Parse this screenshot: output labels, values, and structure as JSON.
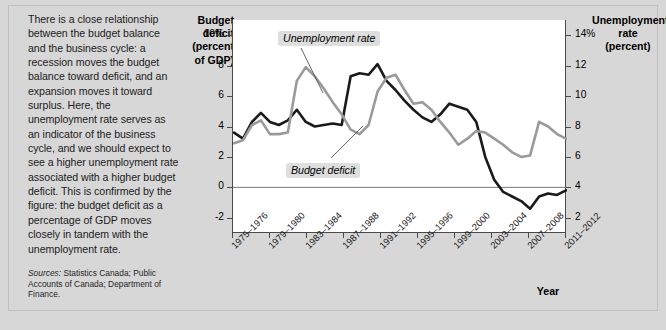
{
  "figure": {
    "caption": "There is a close relationship between the budget balance and the business cycle: a recession moves the budget balance toward deficit, and an expansion moves it toward surplus. Here, the unemployment rate serves as an indicator of the business cycle, and we should expect to see a higher unemployment rate associated with a higher budget deficit. This is confirmed by the figure: the budget deficit as a percentage of GDP moves closely in tandem with the unemployment rate.",
    "sources_label": "Sources:",
    "sources_text": "Statistics Canada; Public Accounts of Canada; Department of Finance."
  },
  "chart_data": {
    "type": "line",
    "title": "",
    "xlabel": "Year",
    "ylabel": "Budget deficit (percent of GDP)",
    "ylabel_lines": [
      "Budget",
      "deficit",
      "(percent",
      "of GDP)"
    ],
    "y2label": "Unemployment rate (percent)",
    "y2label_lines": [
      "Unemployment",
      "rate",
      "(percent)"
    ],
    "grid": false,
    "legend_position": "inline-annotations",
    "ylim": [
      -3,
      11
    ],
    "yticks": [
      10,
      8,
      6,
      4,
      2,
      0,
      -2
    ],
    "ytick_labels": [
      "10%",
      "8",
      "6",
      "4",
      "2",
      "0",
      "-2"
    ],
    "y2lim": [
      1,
      15
    ],
    "y2ticks": [
      14,
      12,
      10,
      8,
      6,
      4,
      2
    ],
    "y2tick_labels": [
      "14%",
      "12",
      "10",
      "8",
      "6",
      "4",
      "2"
    ],
    "zero_line": 0,
    "xtick_labels": [
      "1975–1976",
      "1979–1980",
      "1983–1984",
      "1987–1988",
      "1991–1992",
      "1995–1996",
      "1999–2000",
      "2003–2004",
      "2007–2008",
      "2011–2012"
    ],
    "x_start_year": 1975,
    "x_end_year": 2012,
    "series": [
      {
        "name": "Budget deficit",
        "axis": "left",
        "color": "#1a1a1a",
        "x": [
          1975,
          1976,
          1977,
          1978,
          1979,
          1980,
          1981,
          1982,
          1983,
          1984,
          1985,
          1986,
          1987,
          1988,
          1989,
          1990,
          1991,
          1992,
          1993,
          1994,
          1995,
          1996,
          1997,
          1998,
          1999,
          2000,
          2001,
          2002,
          2003,
          2004,
          2005,
          2006,
          2007,
          2008,
          2009,
          2010,
          2011,
          2012
        ],
        "values": [
          3.6,
          3.2,
          4.3,
          4.9,
          4.3,
          4.1,
          4.4,
          5.1,
          4.3,
          4.0,
          4.1,
          4.2,
          4.1,
          7.3,
          7.5,
          7.4,
          8.1,
          7.0,
          6.4,
          5.7,
          5.1,
          4.6,
          4.3,
          4.8,
          5.5,
          5.3,
          5.1,
          4.3,
          2.0,
          0.5,
          -0.3,
          -0.6,
          -0.9,
          -1.4,
          -0.6,
          -0.4,
          -0.5,
          -0.2
        ]
      },
      {
        "name": "Unemployment rate",
        "axis": "right",
        "color": "#9a9a9a",
        "x": [
          1975,
          1976,
          1977,
          1978,
          1979,
          1980,
          1981,
          1982,
          1983,
          1984,
          1985,
          1986,
          1987,
          1988,
          1989,
          1990,
          1991,
          1992,
          1993,
          1994,
          1995,
          1996,
          1997,
          1998,
          1999,
          2000,
          2001,
          2002,
          2003,
          2004,
          2005,
          2006,
          2007,
          2008,
          2009,
          2010,
          2011,
          2012
        ],
        "values": [
          6.9,
          7.1,
          8.1,
          8.4,
          7.5,
          7.5,
          7.6,
          11.0,
          11.9,
          11.3,
          10.5,
          9.6,
          8.8,
          7.8,
          7.5,
          8.1,
          10.3,
          11.2,
          11.4,
          10.4,
          9.5,
          9.6,
          9.1,
          8.3,
          7.6,
          6.8,
          7.2,
          7.7,
          7.6,
          7.2,
          6.8,
          6.3,
          6.0,
          6.1,
          8.3,
          8.0,
          7.5,
          7.2
        ]
      }
    ],
    "annotations": [
      {
        "text": "Unemployment rate",
        "target_series": "Unemployment rate"
      },
      {
        "text": "Budget deficit",
        "target_series": "Budget deficit"
      }
    ]
  }
}
